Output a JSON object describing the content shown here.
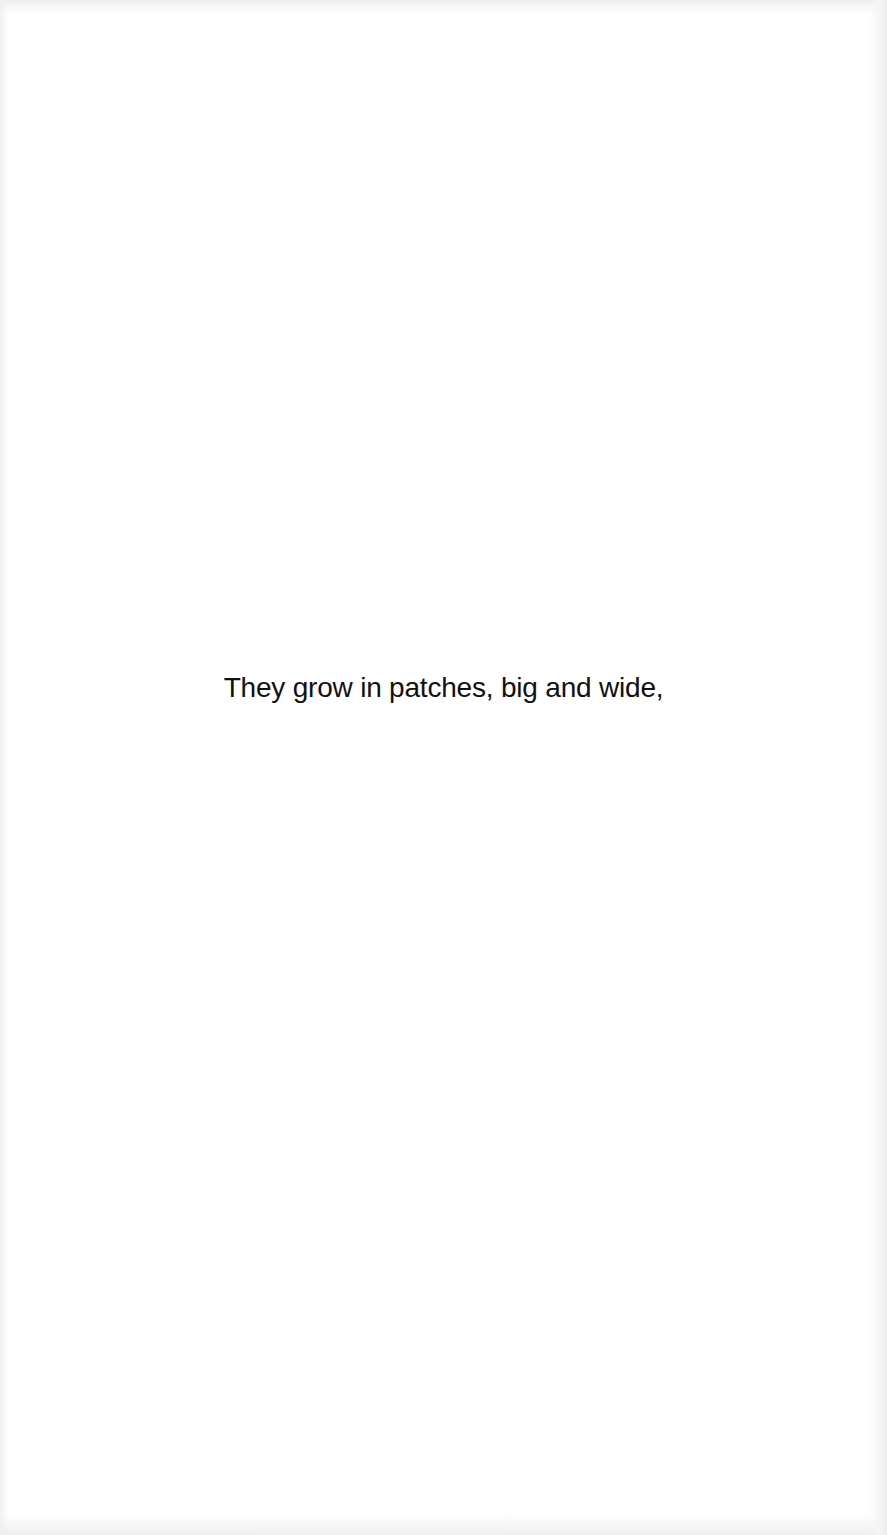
{
  "page": {
    "lines": [
      "They grow in patches, big and wide,"
    ],
    "text_color": "#111111",
    "background_color": "#ffffff"
  }
}
